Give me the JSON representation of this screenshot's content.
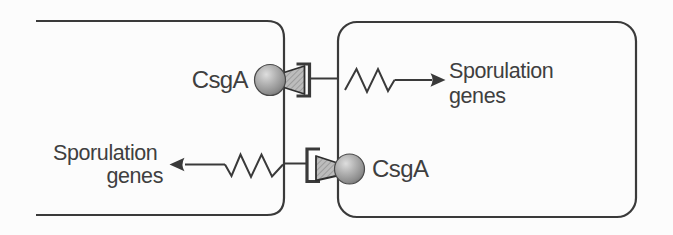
{
  "figure": {
    "type": "cell-signaling-diagram",
    "colors": {
      "background": "#fcfcfc",
      "stroke": "#3a3a3a",
      "text": "#3f3f3f",
      "ball_highlight": "#dedede",
      "ball_mid": "#9a9a9a",
      "ball_dark": "#5c5c5c",
      "cone_fill": "#bcbcbc",
      "cone_hatch": "#8f8f8f"
    },
    "cells": {
      "left": {
        "name": "left-cell",
        "target_genes": {
          "line1": "Sporulation",
          "line2": "genes"
        }
      },
      "right": {
        "name": "right-cell",
        "target_genes": {
          "line1": "Sporulation",
          "line2": "genes"
        }
      }
    },
    "signals": {
      "top": {
        "ligand_label": "CsgA",
        "direction": "left-to-right",
        "parts": [
          "csga-protein-ball",
          "signal-cone",
          "receptor-bracket",
          "zigzag-signal-line",
          "activation-arrow"
        ]
      },
      "bottom": {
        "ligand_label": "CsgA",
        "direction": "right-to-left",
        "parts": [
          "csga-protein-ball",
          "signal-cone",
          "receptor-bracket",
          "zigzag-signal-line",
          "activation-arrow"
        ]
      }
    }
  }
}
